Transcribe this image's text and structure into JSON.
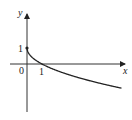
{
  "chart_data": {
    "type": "line",
    "title": "",
    "xlabel": "x",
    "ylabel": "y",
    "function": "y = 1 - sqrt(x)",
    "series": [
      {
        "name": "curve",
        "x": [
          0,
          0.25,
          1,
          2,
          3,
          4,
          5,
          6.3
        ],
        "y": [
          1,
          0.5,
          0,
          -0.41,
          -0.73,
          -1,
          -1.24,
          -1.51
        ]
      }
    ],
    "annotations": [
      {
        "label": "1",
        "at": "y-axis",
        "value": 1
      },
      {
        "label": "0",
        "at": "origin"
      },
      {
        "label": "1",
        "at": "x-axis",
        "value": 1
      }
    ],
    "marked_point": [
      0,
      1
    ],
    "grid": false
  },
  "labels": {
    "y_axis": "y",
    "x_axis": "x",
    "origin": "0",
    "y_tick": "1",
    "x_tick": "1"
  }
}
